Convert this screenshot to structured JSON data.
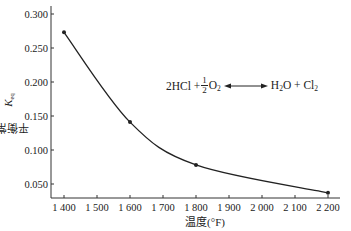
{
  "chart_data": {
    "type": "line",
    "title": "",
    "xlabel": "温度(°F)",
    "ylabel": "平衡常数K_eq",
    "ylabel_main": "平衡常数",
    "ylabel_symbol": "K",
    "ylabel_sub": "eq",
    "xlim": [
      1360,
      2210
    ],
    "ylim": [
      0.03,
      0.305
    ],
    "x_ticks": [
      1400,
      1500,
      1600,
      1700,
      1800,
      1900,
      2000,
      2100,
      2200
    ],
    "x_tick_labels": [
      "1 400",
      "1 500",
      "1 600",
      "1 700",
      "1 800",
      "1 900",
      "2 000",
      "2 100",
      "2 200"
    ],
    "y_ticks": [
      0.05,
      0.1,
      0.15,
      0.2,
      0.25,
      0.3
    ],
    "y_tick_labels": [
      "0.050",
      "0.100",
      "0.150",
      "0.200",
      "0.250",
      "0.300"
    ],
    "grid": false,
    "legend": null,
    "series": [
      {
        "name": "Keq",
        "x": [
          1400,
          1600,
          1800,
          2200
        ],
        "values": [
          0.273,
          0.141,
          0.078,
          0.037
        ],
        "markers": true,
        "smooth": true,
        "color": "#222222"
      }
    ],
    "annotations": [
      {
        "text": "2HCl + 1/2 O2 ⟷ H2O + Cl2",
        "position": "upper right"
      }
    ]
  },
  "equation": {
    "left_a": "2HCl + ",
    "frac_num": "1",
    "frac_den": "2",
    "o2": "O",
    "o2_sub": "2",
    "h2o_h": "H",
    "h2o_sub": "2",
    "h2o_o": "O + Cl",
    "cl2_sub": "2"
  }
}
